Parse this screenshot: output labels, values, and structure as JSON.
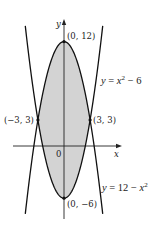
{
  "chart_data": {
    "type": "line",
    "title": "",
    "xlabel": "x",
    "ylabel": "y",
    "origin_label": "0",
    "xlim": [
      -7.4,
      10.6
    ],
    "ylim": [
      -8.0,
      14.0
    ],
    "shaded_region": {
      "between": [
        "y = 12 - x^2",
        "y = x^2 - 6"
      ],
      "x_range": [
        -3,
        3
      ],
      "color": "#d3d3d3"
    },
    "series": [
      {
        "name": "y = x^2 - 6",
        "expr": "x^2 - 6",
        "x_range": [
          -4.45,
          4.45
        ],
        "label": {
          "prefix": "y = ",
          "var": "x",
          "sup": "2",
          "suffix": " − 6"
        }
      },
      {
        "name": "y = 12 - x^2",
        "expr": "12 - x^2",
        "x_range": [
          -4.45,
          4.45
        ],
        "label": {
          "prefix": "y = 12 − ",
          "var": "x",
          "sup": "2",
          "suffix": ""
        }
      }
    ],
    "points": [
      {
        "x": 0,
        "y": 12,
        "label": "(0, 12)"
      },
      {
        "x": -3,
        "y": 3,
        "label": "(−3, 3)"
      },
      {
        "x": 3,
        "y": 3,
        "label": "(3, 3)"
      },
      {
        "x": 0,
        "y": -6,
        "label": "(0, −6)"
      }
    ],
    "colors": {
      "curve": "#111111",
      "fill": "#d3d3d3",
      "axis": "#222222"
    }
  }
}
